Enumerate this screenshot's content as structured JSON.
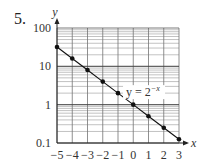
{
  "problem_number": "5.",
  "chart_data": {
    "type": "line",
    "title": "",
    "scale": {
      "x": "linear",
      "y": "log"
    },
    "xlabel": "x",
    "ylabel": "y",
    "xlim": [
      -5,
      3
    ],
    "ylim": [
      0.1,
      100
    ],
    "x_ticks": [
      "-5",
      "-4",
      "-3",
      "-2",
      "-1",
      "0",
      "1",
      "2",
      "3"
    ],
    "y_ticks": [
      "0.1",
      "1",
      "10",
      "100"
    ],
    "grid": true,
    "series": [
      {
        "name": "y = 2^-x",
        "x": [
          -5,
          -4,
          -3,
          -2,
          -1,
          0,
          1,
          2,
          3
        ],
        "values": [
          32,
          16,
          8,
          4,
          2,
          1,
          0.5,
          0.25,
          0.125
        ],
        "markers": true
      }
    ],
    "annotations": [
      {
        "text": "y = 2",
        "superscript": "−x",
        "x": 0,
        "y": 2
      }
    ]
  },
  "labels": {
    "curve_label_base": "y = 2",
    "curve_label_exp": "−x",
    "x_axis": "x",
    "y_axis": "y"
  }
}
